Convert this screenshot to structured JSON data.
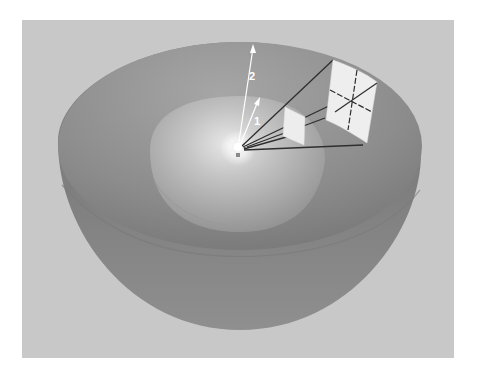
{
  "figure": {
    "colors": {
      "background_panel": "#c9c9c9",
      "outer_shell": "#8e8e8e",
      "inner_bowl": "#b8b8b8",
      "patch": "#ececec",
      "rays": "#333333",
      "arrows": "#ffffff"
    },
    "labels": {
      "arrow_1": "1",
      "arrow_2": "2"
    }
  }
}
